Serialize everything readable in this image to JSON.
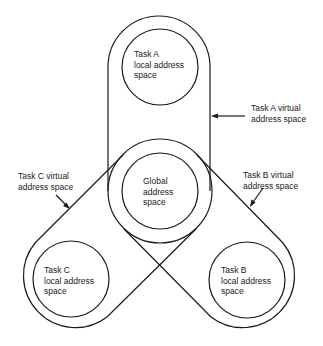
{
  "diagram": {
    "labels": {
      "task_a_local": "Task A\nlocal address\nspace",
      "task_a_virtual": "Task A virtual\naddress space",
      "global": "Global\naddress\nspace",
      "task_b_local": "Task B\nlocal address\nspace",
      "task_b_virtual": "Task B virtual\naddress space",
      "task_c_local": "Task C\nlocal address\nspace",
      "task_c_virtual": "Task C virtual\naddress space"
    },
    "colors": {
      "stroke": "#1a1a1a",
      "background": "#ffffff"
    }
  }
}
